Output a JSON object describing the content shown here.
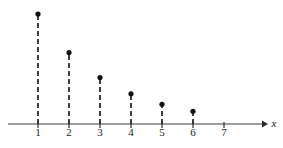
{
  "chart_data": {
    "type": "bar",
    "style": "stem-lollipop",
    "title": "",
    "subtitle": "",
    "xlabel": "x",
    "ylabel": "",
    "categories": [
      "1",
      "2",
      "3",
      "4",
      "5",
      "6"
    ],
    "x": [
      1,
      2,
      3,
      4,
      5,
      6
    ],
    "values": [
      0.35,
      0.2275,
      0.148,
      0.096,
      0.0625,
      0.0406
    ],
    "pixel_heights": [
      110,
      69,
      47,
      32,
      20,
      11
    ],
    "xtick_labels": [
      "1",
      "2",
      "3",
      "4",
      "5",
      "6",
      "7"
    ],
    "xticks": [
      1,
      2,
      3,
      4,
      5,
      6,
      7
    ],
    "xlim": [
      0.25,
      8.3
    ],
    "ylim": [
      0,
      0.385
    ],
    "grid": false,
    "legend": null,
    "annotations": [],
    "marker": "filled-circle",
    "stem_style": "dashed",
    "axis_arrow": true
  },
  "axis": {
    "line_color": "#7d7d7d",
    "tick_color": "#3a3a3a",
    "label_color": "#1a1a1a",
    "x_axis_label": "x"
  },
  "series_style": {
    "stem_color": "#2b2b2b",
    "marker_color": "#111111",
    "marker_radius": 2.6
  },
  "geometry": {
    "baseline_y": 124,
    "axis_start_x": 8,
    "axis_end_x": 266,
    "tick_spacing_px": 31,
    "first_tick_x": 38,
    "tick_below_px": 4,
    "label_y": 136,
    "x_label_x": 274,
    "x_label_y": 127
  }
}
